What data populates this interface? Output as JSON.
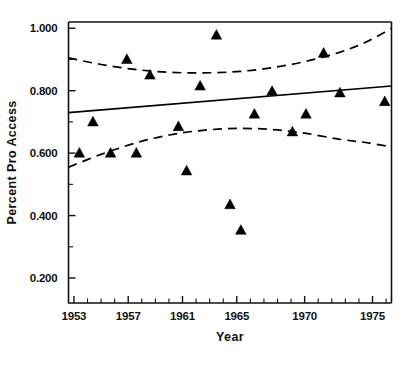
{
  "chart_data": {
    "type": "scatter",
    "title": "",
    "xlabel": "Year",
    "ylabel": "Percent Pro Access",
    "xlim": [
      1952.6,
      1976.4
    ],
    "ylim": [
      0.12,
      1.02
    ],
    "grid": false,
    "legend": null,
    "xticks": [
      1953,
      1957,
      1961,
      1965,
      1970,
      1975
    ],
    "xtick_labels": [
      "1953",
      "1957",
      "1961",
      "1965",
      "1970",
      "1975"
    ],
    "yticks": [
      0.2,
      0.4,
      0.6,
      0.8,
      1.0
    ],
    "ytick_labels": [
      "0.200",
      "0.400",
      "0.600",
      "0.800",
      "1.000"
    ],
    "x_minor_ticks": [
      1954,
      1955,
      1956,
      1958,
      1959,
      1960,
      1962,
      1963,
      1964,
      1966,
      1967,
      1968,
      1969,
      1971,
      1972,
      1973,
      1974,
      1976
    ],
    "y_minor_ticks": [
      0.3,
      0.5,
      0.7,
      0.9
    ],
    "marker": "triangle-up",
    "marker_color": "#000000",
    "points": [
      {
        "x": 1953.4,
        "y": 0.6
      },
      {
        "x": 1954.4,
        "y": 0.7
      },
      {
        "x": 1955.7,
        "y": 0.6
      },
      {
        "x": 1956.9,
        "y": 0.9
      },
      {
        "x": 1957.6,
        "y": 0.6
      },
      {
        "x": 1958.6,
        "y": 0.85
      },
      {
        "x": 1960.7,
        "y": 0.685
      },
      {
        "x": 1961.3,
        "y": 0.543
      },
      {
        "x": 1962.3,
        "y": 0.815
      },
      {
        "x": 1963.5,
        "y": 0.978
      },
      {
        "x": 1964.5,
        "y": 0.435
      },
      {
        "x": 1965.3,
        "y": 0.353
      },
      {
        "x": 1966.3,
        "y": 0.725
      },
      {
        "x": 1967.6,
        "y": 0.798
      },
      {
        "x": 1969.1,
        "y": 0.668
      },
      {
        "x": 1970.1,
        "y": 0.725
      },
      {
        "x": 1971.4,
        "y": 0.92
      },
      {
        "x": 1972.6,
        "y": 0.793
      },
      {
        "x": 1975.9,
        "y": 0.765
      }
    ],
    "series": [
      {
        "name": "regression-fit",
        "style": "solid",
        "x": [
          1952.6,
          1976.4
        ],
        "values": [
          0.73,
          0.815
        ]
      },
      {
        "name": "upper-confidence-band",
        "style": "dashed",
        "x": [
          1952.6,
          1955.0,
          1957.5,
          1960.0,
          1962.5,
          1965.0,
          1967.5,
          1970.0,
          1972.5,
          1974.5,
          1976.4
        ],
        "values": [
          0.905,
          0.884,
          0.868,
          0.859,
          0.857,
          0.861,
          0.873,
          0.893,
          0.922,
          0.955,
          1.0
        ]
      },
      {
        "name": "lower-confidence-band",
        "style": "dashed",
        "x": [
          1952.6,
          1955.0,
          1957.5,
          1960.0,
          1962.5,
          1965.0,
          1967.5,
          1970.0,
          1972.5,
          1974.5,
          1976.4
        ],
        "values": [
          0.555,
          0.596,
          0.632,
          0.658,
          0.673,
          0.679,
          0.676,
          0.664,
          0.645,
          0.634,
          0.62
        ]
      }
    ]
  }
}
